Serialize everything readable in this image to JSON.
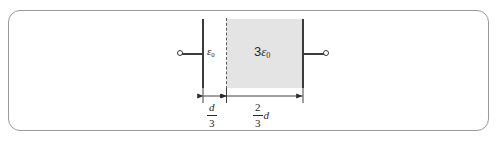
{
  "figure": {
    "type": "physics-diagram",
    "colors": {
      "frame_border": "#9a9a9a",
      "plate": "#3b3b3b",
      "dielectric_fill": "#e4e4e4",
      "dashed_boundary": "#5a5a5a",
      "text": "#2a2a2a",
      "background": "#ffffff"
    },
    "regions": [
      {
        "id": "vacuum-gap",
        "permittivity_coefficient": "",
        "permittivity_symbol": "ε",
        "permittivity_subscript": "0",
        "width_label_numerator": "d",
        "width_label_denominator": "3",
        "filled": false
      },
      {
        "id": "dielectric-slab",
        "permittivity_coefficient": "3",
        "permittivity_symbol": "ε",
        "permittivity_subscript": "0",
        "width_label_numerator": "2",
        "width_label_denominator": "3",
        "width_label_suffix": "d",
        "filled": true
      }
    ],
    "terminals": {
      "left_label": "",
      "right_label": ""
    }
  }
}
